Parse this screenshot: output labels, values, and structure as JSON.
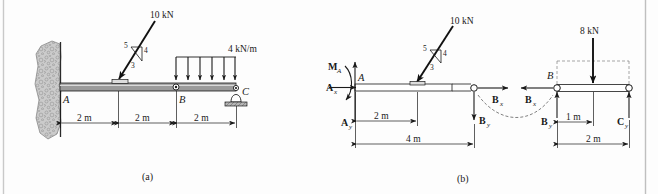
{
  "figure": {
    "panels": [
      {
        "id": "a",
        "caption": "(a)"
      },
      {
        "id": "b",
        "caption": "(b)"
      }
    ]
  },
  "colors": {
    "ink": "#1a1a1a",
    "beam_fill": "#9a9a9a",
    "beam_fill_fbd": "#ffffff",
    "wall_fill": "#c8c8c8",
    "dashed_gray": "#808080",
    "page_bg": "#fdfdfd",
    "border": "#bfbfbf"
  },
  "panel_a": {
    "caption": "(a)",
    "point_load": {
      "label": "10 kN",
      "slope_hyp": "5",
      "slope_vert": "4",
      "slope_horiz": "3"
    },
    "distributed_load": {
      "label": "4 kN/m",
      "arrow_count": 6
    },
    "joints": [
      {
        "name": "A",
        "type": "fixed-wall-support"
      },
      {
        "name": "B",
        "type": "pin-connection"
      },
      {
        "name": "C",
        "type": "rocker-support"
      }
    ],
    "dimensions": [
      {
        "label": "2 m"
      },
      {
        "label": "2 m"
      },
      {
        "label": "2 m"
      }
    ]
  },
  "panel_b": {
    "caption": "(b)",
    "left_segment": {
      "point_load": {
        "label": "10 kN",
        "slope_hyp": "5",
        "slope_vert": "4",
        "slope_horiz": "3"
      },
      "joint_label": "A",
      "reactions": [
        {
          "symbol": "M",
          "subscript": "A",
          "kind": "moment-curved-arrow"
        },
        {
          "symbol": "A",
          "subscript": "x",
          "kind": "force-horizontal-right"
        },
        {
          "symbol": "A",
          "subscript": "y",
          "kind": "force-vertical-up"
        },
        {
          "symbol": "B",
          "subscript": "x",
          "kind": "force-horizontal-right"
        },
        {
          "symbol": "B",
          "subscript": "y",
          "kind": "force-vertical-down"
        }
      ],
      "dimensions": [
        {
          "label": "2 m"
        },
        {
          "label": "4 m"
        }
      ]
    },
    "right_segment": {
      "resultant_load": {
        "label": "8 kN"
      },
      "joint_label": "B",
      "reactions": [
        {
          "symbol": "B",
          "subscript": "x",
          "kind": "force-horizontal-left"
        },
        {
          "symbol": "B",
          "subscript": "y",
          "kind": "force-vertical-up"
        },
        {
          "symbol": "C",
          "subscript": "y",
          "kind": "force-vertical-up"
        }
      ],
      "dimensions": [
        {
          "label": "1 m"
        },
        {
          "label": "2 m"
        }
      ]
    }
  }
}
